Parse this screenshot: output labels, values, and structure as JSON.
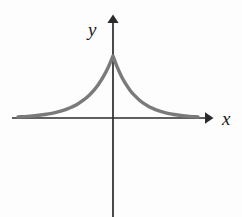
{
  "figure": {
    "name": "coordinate-plane-exponential-cusp",
    "background_color": "#fdfdfd",
    "axis_color": "#2b2b2b",
    "curve_color": "#7a7a7a",
    "label_color": "#1a1a1a"
  },
  "labels": {
    "x_axis": "x",
    "y_axis": "y",
    "top_fragment": "p"
  },
  "chart_data": {
    "type": "line",
    "title": "",
    "subtitle": "",
    "xlabel": "x",
    "ylabel": "y",
    "grid": false,
    "legend": null,
    "annotations": [],
    "xlim": [
      -4,
      4
    ],
    "ylim": [
      0,
      1.15
    ],
    "xticks": [],
    "yticks": [],
    "series": [
      {
        "name": "exp(-|x|)",
        "color": "#7a7a7a",
        "x": [
          -4,
          -3.6,
          -3.2,
          -2.8,
          -2.4,
          -2,
          -1.75,
          -1.5,
          -1.25,
          -1,
          -0.8,
          -0.6,
          -0.4,
          -0.2,
          0,
          0.2,
          0.4,
          0.6,
          0.8,
          1,
          1.25,
          1.5,
          1.75,
          2,
          2.4,
          2.8,
          3.2,
          3.6,
          4
        ],
        "y": [
          0.018,
          0.027,
          0.041,
          0.061,
          0.091,
          0.135,
          0.174,
          0.223,
          0.287,
          0.368,
          0.449,
          0.549,
          0.67,
          0.819,
          1,
          0.819,
          0.67,
          0.549,
          0.449,
          0.368,
          0.287,
          0.223,
          0.174,
          0.135,
          0.091,
          0.061,
          0.041,
          0.027,
          0.018
        ]
      }
    ]
  },
  "geometry": {
    "origin_px": [
      113,
      118
    ],
    "x_axis_start_px": 12,
    "x_axis_end_px": 212,
    "y_axis_top_px": 15,
    "y_axis_bottom_px": 217,
    "peak_px": [
      113,
      56
    ],
    "curve_left_merge_px": 42,
    "curve_right_merge_px": 184,
    "axis_stroke_width": 1.7,
    "curve_stroke_width": 3.4
  }
}
